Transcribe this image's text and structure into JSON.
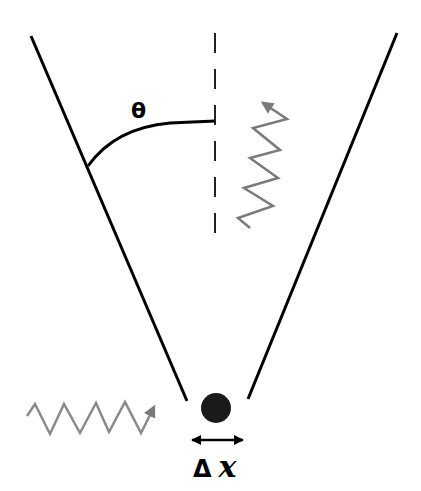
{
  "diagram": {
    "labels": {
      "angle": "θ",
      "uncertainty_delta": "Δ",
      "uncertainty_var": "x"
    },
    "colors": {
      "lines": "#000000",
      "photon_waves": "#7a7a7a",
      "particle": "#1a1a1a",
      "background": "#ffffff"
    },
    "elements": {
      "cone_left_edge": {
        "x1": 31,
        "y1": 36,
        "x2": 187,
        "y2": 401
      },
      "cone_right_edge": {
        "x1": 397,
        "y1": 33,
        "x2": 248,
        "y2": 399
      },
      "optical_axis": {
        "x": 215,
        "y1": 33,
        "y2": 237,
        "style": "dashed"
      },
      "particle": {
        "cx": 216,
        "cy": 408,
        "r": 15
      },
      "incident_photon": "gray zigzag arrow from left toward particle",
      "scattered_photon": "gray zigzag arrow going upward into cone",
      "uncertainty_arrow": "double-headed horizontal arrow under particle"
    }
  }
}
